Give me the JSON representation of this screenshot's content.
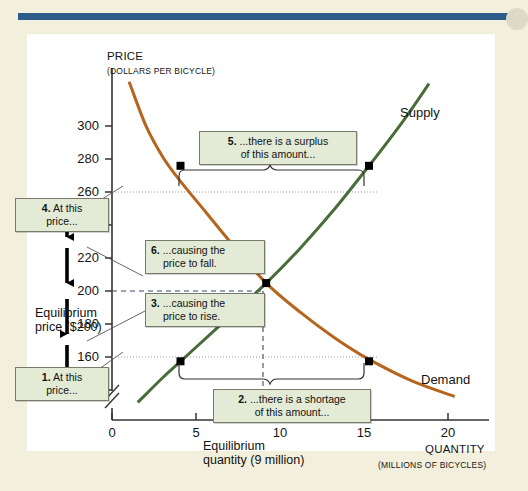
{
  "figure": {
    "panel_bg": "#ffffff",
    "page_bg": "#f2efdc",
    "rule_color": "#2d5c8a"
  },
  "chart_data": {
    "type": "line",
    "title": "",
    "xlabel": "QUANTITY",
    "xlabel_sub": "(MILLIONS OF BICYCLES)",
    "ylabel": "PRICE",
    "ylabel_sub": "(DOLLARS PER BICYCLE)",
    "xlim": [
      0,
      22
    ],
    "ylim": [
      130,
      310
    ],
    "xticks": [
      "0",
      "5",
      "10",
      "15",
      "20"
    ],
    "xtick_values": [
      0,
      5,
      10,
      15,
      20
    ],
    "yticks": [
      "140",
      "160",
      "180",
      "200",
      "220",
      "240",
      "260",
      "280",
      "300"
    ],
    "ytick_values": [
      140,
      160,
      180,
      200,
      220,
      240,
      260,
      280,
      300
    ],
    "axis_break": true,
    "grid": false,
    "legend": "inline-curve-labels",
    "series": [
      {
        "name": "Demand",
        "color": "#b5651d",
        "points": [
          {
            "q": 1.0,
            "p": 303
          },
          {
            "q": 2.0,
            "p": 280
          },
          {
            "q": 3.0,
            "p": 264
          },
          {
            "q": 4.0,
            "p": 252
          },
          {
            "q": 5.5,
            "p": 236
          },
          {
            "q": 7.0,
            "p": 220
          },
          {
            "q": 9.0,
            "p": 200
          },
          {
            "q": 11.0,
            "p": 185
          },
          {
            "q": 13.0,
            "p": 172
          },
          {
            "q": 15.0,
            "p": 161
          },
          {
            "q": 17.5,
            "p": 150
          },
          {
            "q": 20.0,
            "p": 142
          }
        ]
      },
      {
        "name": "Supply",
        "color": "#4a6b3a",
        "points": [
          {
            "q": 1.5,
            "p": 139
          },
          {
            "q": 3.0,
            "p": 152
          },
          {
            "q": 4.0,
            "p": 160
          },
          {
            "q": 5.5,
            "p": 172
          },
          {
            "q": 7.0,
            "p": 184
          },
          {
            "q": 9.0,
            "p": 200
          },
          {
            "q": 11.0,
            "p": 218
          },
          {
            "q": 13.0,
            "p": 238
          },
          {
            "q": 15.0,
            "p": 260
          },
          {
            "q": 17.0,
            "p": 283
          },
          {
            "q": 18.5,
            "p": 302
          }
        ]
      }
    ],
    "markers": [
      {
        "name": "demand-at-260",
        "q": 4.0,
        "p": 260
      },
      {
        "name": "supply-at-260",
        "q": 15.0,
        "p": 260
      },
      {
        "name": "equilibrium",
        "q": 9.0,
        "p": 200
      },
      {
        "name": "supply-at-160",
        "q": 4.0,
        "p": 160
      },
      {
        "name": "demand-at-160",
        "q": 15.0,
        "p": 160
      }
    ],
    "equilibrium": {
      "quantity": 9,
      "price": 200
    },
    "surplus": {
      "price": 260,
      "from_q": 4,
      "to_q": 15
    },
    "shortage": {
      "price": 160,
      "from_q": 4,
      "to_q": 15
    }
  },
  "labels": {
    "supply": "Supply",
    "demand": "Demand",
    "equilibrium_price": "Equilibrium",
    "equilibrium_price_2": "price ($200)",
    "equilibrium_quantity": "Equilibrium",
    "equilibrium_quantity_2": "quantity (9 million)"
  },
  "callouts": [
    {
      "id": 1,
      "num": "1.",
      "line1": "At this",
      "line2": "price..."
    },
    {
      "id": 2,
      "num": "2.",
      "line1": "...there is a shortage",
      "line2": "of this amount..."
    },
    {
      "id": 3,
      "num": "3.",
      "line1": "...causing the",
      "line2": "price to rise."
    },
    {
      "id": 4,
      "num": "4.",
      "line1": "At this",
      "line2": "price..."
    },
    {
      "id": 5,
      "num": "5.",
      "line1": "...there is a surplus",
      "line2": "of this amount..."
    },
    {
      "id": 6,
      "num": "6.",
      "line1": "...causing the",
      "line2": "price to fall."
    }
  ]
}
